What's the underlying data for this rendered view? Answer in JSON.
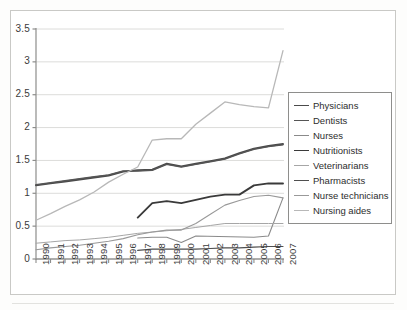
{
  "chart_data": {
    "type": "line",
    "title": "",
    "subtitle": "",
    "xlabel": "",
    "ylabel": "",
    "x": [
      1990,
      1991,
      1992,
      1993,
      1994,
      1995,
      1996,
      1997,
      1998,
      1999,
      2000,
      2001,
      2002,
      2003,
      2004,
      2005,
      2006,
      2007
    ],
    "xtick_labels": [
      "1990",
      "1991",
      "1992",
      "1993",
      "1994",
      "1995",
      "1996",
      "1997",
      "1998",
      "1999",
      "2000",
      "2001",
      "2002",
      "2003",
      "2004",
      "2005",
      "2006",
      "2007"
    ],
    "ytick_labels": [
      "0",
      "0.5",
      "1",
      "1.5",
      "2",
      "2.5",
      "3",
      "3.5"
    ],
    "ytick_values": [
      0,
      0.5,
      1,
      1.5,
      2,
      2.5,
      3,
      3.5
    ],
    "ylim": [
      0,
      3.5
    ],
    "xlim": [
      1990,
      2007
    ],
    "grid": "horizontal",
    "legend_position": "right",
    "series": [
      {
        "name": "Physicians",
        "color": "#4a4a4a",
        "width": 1.9,
        "x": [
          1990,
          1991,
          1992,
          1993,
          1994,
          1995,
          1996,
          1997,
          1998,
          1999,
          2000,
          2001,
          2002,
          2003,
          2004,
          2005,
          2006,
          2007
        ],
        "values": [
          1.12,
          1.15,
          1.18,
          1.21,
          1.24,
          1.27,
          1.33,
          1.35,
          1.36,
          1.45,
          1.41,
          1.45,
          1.49,
          1.53,
          1.61,
          1.68,
          1.72,
          1.75
        ]
      },
      {
        "name": "Dentists",
        "color": "#555555",
        "width": 1.5,
        "x": [
          1990,
          1991,
          1992,
          1993,
          1994,
          1995,
          1996,
          1997,
          1998,
          1999,
          2000,
          2001,
          2002,
          2003,
          2004,
          2005,
          2006,
          2007
        ],
        "values": [
          1.13,
          1.16,
          1.19,
          1.22,
          1.25,
          1.28,
          1.34,
          1.34,
          1.35,
          1.44,
          1.4,
          1.44,
          1.48,
          1.52,
          1.6,
          1.67,
          1.71,
          1.74
        ]
      },
      {
        "name": "Nurses",
        "color": "#8a8a8a",
        "width": 1.1,
        "x": [
          1997,
          1998,
          1999,
          2000,
          2001,
          2005,
          2006,
          2007
        ],
        "values": [
          0.32,
          0.33,
          0.33,
          0.25,
          0.35,
          0.33,
          0.35,
          0.93
        ]
      },
      {
        "name": "Nutritionists",
        "color": "#3a3a3a",
        "width": 1.9,
        "x": [
          1997,
          1998,
          1999,
          2000,
          2001,
          2002,
          2003,
          2004,
          2005,
          2006,
          2007
        ],
        "values": [
          0.63,
          0.85,
          0.88,
          0.85,
          0.9,
          0.95,
          0.98,
          0.98,
          1.12,
          1.15,
          1.15
        ]
      },
      {
        "name": "Veterinarians",
        "color": "#a6a6a6",
        "width": 1.0,
        "x": [
          1990,
          1991,
          1992,
          1993,
          1994,
          1995,
          1996,
          1997,
          1998,
          1999,
          2000,
          2001,
          2002,
          2003,
          2004,
          2005,
          2006,
          2007
        ],
        "values": [
          0.24,
          0.26,
          0.28,
          0.29,
          0.31,
          0.33,
          0.36,
          0.39,
          0.41,
          0.43,
          0.45,
          0.48,
          0.51,
          0.54,
          0.54,
          0.54,
          0.54,
          0.54
        ]
      },
      {
        "name": "Pharmacists",
        "color": "#4f4f4f",
        "width": 1.2,
        "x": [
          1997,
          1998,
          1999,
          2000,
          2001,
          2002,
          2003,
          2004,
          2005,
          2006,
          2007
        ],
        "values": [
          0.13,
          0.15,
          0.15,
          0.15,
          0.15,
          0.16,
          0.17,
          0.17,
          0.18,
          0.19,
          0.19
        ]
      },
      {
        "name": "Nurse technicians",
        "color": "#999999",
        "width": 1.1,
        "x": [
          1990,
          1991,
          1992,
          1993,
          1994,
          1995,
          1996,
          1997,
          1998,
          1999,
          2000,
          2001,
          2002,
          2003,
          2004,
          2005,
          2006,
          2007
        ],
        "values": [
          0.14,
          0.17,
          0.19,
          0.21,
          0.24,
          0.27,
          0.31,
          0.37,
          0.41,
          0.44,
          0.44,
          0.54,
          0.68,
          0.82,
          0.89,
          0.95,
          0.97,
          0.93
        ]
      },
      {
        "name": "Nursing aides",
        "color": "#b8b8b8",
        "width": 1.3,
        "x": [
          1990,
          1991,
          1992,
          1993,
          1994,
          1995,
          1996,
          1997,
          1998,
          1999,
          2000,
          2001,
          2002,
          2003,
          2004,
          2005,
          2006,
          2007
        ],
        "values": [
          0.59,
          0.69,
          0.8,
          0.9,
          1.02,
          1.17,
          1.29,
          1.4,
          1.81,
          1.83,
          1.83,
          2.05,
          2.22,
          2.39,
          2.35,
          2.32,
          2.3,
          3.17
        ]
      }
    ]
  }
}
